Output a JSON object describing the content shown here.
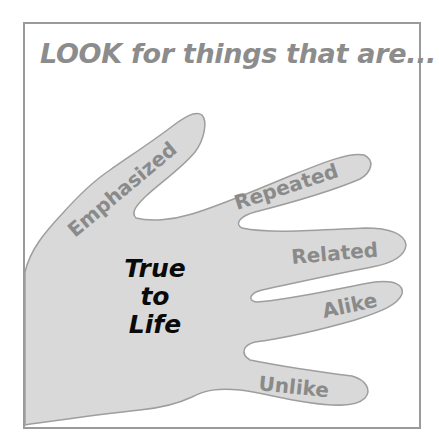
{
  "heading": "LOOK for things that are...",
  "fingers": [
    {
      "id": "thumb",
      "label": "Emphasized"
    },
    {
      "id": "index",
      "label": "Repeated"
    },
    {
      "id": "middle",
      "label": "Related"
    },
    {
      "id": "ring",
      "label": "Alike"
    },
    {
      "id": "little",
      "label": "Unlike"
    }
  ],
  "palm": {
    "lines": [
      "True",
      "to",
      "Life"
    ]
  },
  "colors": {
    "frame": "#9a9a9a",
    "hand_fill": "#d9d9d9",
    "hand_outline": "#9e9e9e",
    "finger_text": "#8a8a8a",
    "heading_text": "#8c8c8c",
    "palm_text": "#0a0a0a"
  }
}
